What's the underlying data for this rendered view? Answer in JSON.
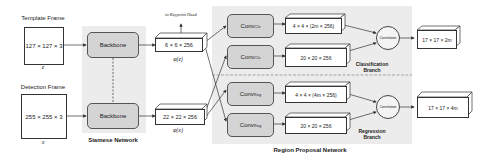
{
  "inputs": {
    "template": {
      "title": "Template Frame",
      "size": "127 × 127 × 3",
      "symbol": "z"
    },
    "detection": {
      "title": "Detection Frame",
      "size": "255 × 255 × 3",
      "symbol": "x"
    }
  },
  "siamese": {
    "label": "Siamese Network",
    "backbone_top": "Backbone",
    "backbone_bottom": "Backbone"
  },
  "features": {
    "template": {
      "size": "6 × 6 × 256",
      "symbol": "φ(z)"
    },
    "detection": {
      "size": "22 × 22 × 256",
      "symbol": "φ(x)"
    },
    "keypoint_note": "to Keypoint Head"
  },
  "rpn": {
    "label": "Region Proposal Network",
    "convs": [
      {
        "base": "Conv",
        "sub": "Cls"
      },
      {
        "base": "Conv",
        "sub": "Cls"
      },
      {
        "base": "Conv",
        "sub": "Reg"
      },
      {
        "base": "Conv",
        "sub": "Reg"
      }
    ],
    "tensors": [
      "4 × 4 × (2m × 256)",
      "20 × 20 × 256",
      "4 × 4 × (4m × 256)",
      "20 × 20 × 256"
    ],
    "classification_branch": {
      "line1": "Classification",
      "line2": "Branch"
    },
    "regression_branch": {
      "line1": "Regression",
      "line2": "Branch"
    },
    "correlation_top": "Correlation",
    "correlation_bottom": "Correlation"
  },
  "outputs": {
    "cls": "17 × 17 × 2m",
    "reg": "17 × 17 × 4m"
  }
}
